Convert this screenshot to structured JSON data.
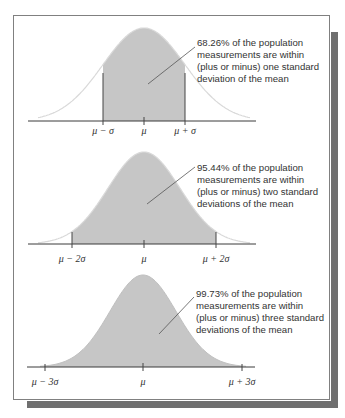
{
  "colors": {
    "fill": "#c6c6c6",
    "curve_outline": "#d9d9d9",
    "axis": "#3a3a3a",
    "border": "#808080",
    "shadow": "#6f6f6f",
    "text": "#333333"
  },
  "panels": [
    {
      "annotation": [
        "68.26% of the population",
        "measurements are within",
        "(plus or minus) one standard",
        "deviation of the mean"
      ],
      "tick_labels": [
        "μ − σ",
        "μ",
        "μ + σ"
      ],
      "sigma_range": 1
    },
    {
      "annotation": [
        "95.44% of the population",
        "measurements are within",
        "(plus or minus) two standard",
        "deviations of the mean"
      ],
      "tick_labels": [
        "μ − 2σ",
        "μ",
        "μ + 2σ"
      ],
      "sigma_range": 2
    },
    {
      "annotation": [
        "99.73% of the population",
        "measurements are within",
        "(plus or minus) three standard",
        "deviations of the mean"
      ],
      "tick_labels": [
        "μ − 3σ",
        "μ",
        "μ + 3σ"
      ],
      "sigma_range": 3
    }
  ]
}
